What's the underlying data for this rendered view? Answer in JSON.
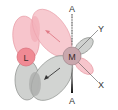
{
  "diagram": {
    "type": "orbital-overlap",
    "atoms": [
      {
        "id": "L",
        "label": "L",
        "color": "#f08a94"
      },
      {
        "id": "M",
        "label": "M",
        "color": "#c9a7ad"
      }
    ],
    "axes": [
      {
        "label": "A",
        "position": "top",
        "style": "dashed"
      },
      {
        "label": "A",
        "position": "bottom",
        "style": "wedge"
      },
      {
        "label": "Y",
        "position": "upper-right"
      },
      {
        "label": "X",
        "position": "lower-right"
      }
    ],
    "colors": {
      "pink_lobe": "#f7c5cc",
      "pink_stroke": "#e89aa4",
      "gray_lobe": "#cfd1cf",
      "gray_stroke": "#8a8d8a",
      "overlap_gray": "#a9aba9",
      "overlap_pink": "#f1a9b2"
    }
  }
}
